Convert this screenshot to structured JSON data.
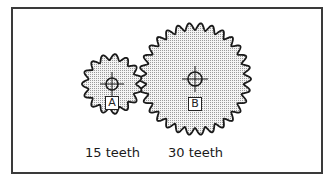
{
  "diagram": {
    "frame": {
      "x": 11,
      "y": 7,
      "w": 310,
      "h": 165,
      "stroke": "#3a3a3a"
    },
    "colors": {
      "stroke": "#1a1a1a",
      "fill": "#eeeeee",
      "stipple": "#9a9a9a",
      "background": "#ffffff"
    },
    "gears": [
      {
        "id": "A",
        "label": "A",
        "teeth": 15,
        "caption": "15 teeth",
        "center": [
          112,
          84
        ],
        "outer_radius": 30,
        "root_radius": 24,
        "hub_radius": 6,
        "label_box": {
          "x": 105,
          "y": 96,
          "w": 14,
          "h": 14
        },
        "caption_pos": {
          "x": 85,
          "y": 146
        }
      },
      {
        "id": "B",
        "label": "B",
        "teeth": 30,
        "caption": "30 teeth",
        "center": [
          195,
          79
        ],
        "outer_radius": 56,
        "root_radius": 49,
        "hub_radius": 7,
        "label_box": {
          "x": 188,
          "y": 97,
          "w": 14,
          "h": 14
        },
        "caption_pos": {
          "x": 168,
          "y": 146
        }
      }
    ]
  }
}
